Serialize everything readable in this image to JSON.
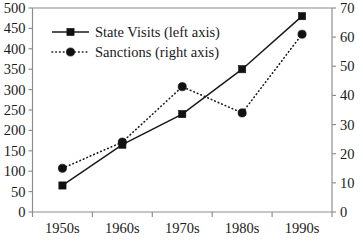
{
  "chart_data": {
    "type": "line",
    "title": "",
    "subtitle": "",
    "xlabel": "",
    "categories": [
      "1950s",
      "1960s",
      "1970s",
      "1980s",
      "1990s"
    ],
    "grid": false,
    "legend_position": "top-left",
    "series": [
      {
        "name": "State Visits (left axis)",
        "axis": "left",
        "marker": "square",
        "line_style": "solid",
        "color": "#111111",
        "values": [
          65,
          165,
          240,
          350,
          480
        ]
      },
      {
        "name": "Sanctions (right axis)",
        "axis": "right",
        "marker": "circle",
        "line_style": "dotted",
        "color": "#111111",
        "values": [
          15,
          24,
          43,
          34,
          61
        ]
      }
    ],
    "left_axis": {
      "label": "",
      "ylim": [
        0,
        500
      ],
      "tick_step": 50,
      "ticks": [
        0,
        50,
        100,
        150,
        200,
        250,
        300,
        350,
        400,
        450,
        500
      ],
      "tick_labels": [
        "0",
        "50",
        "100",
        "150",
        "200",
        "250",
        "300",
        "350",
        "400",
        "450",
        "500"
      ]
    },
    "right_axis": {
      "label": "",
      "ylim": [
        0,
        70
      ],
      "tick_step": 10,
      "ticks": [
        0,
        10,
        20,
        30,
        40,
        50,
        60,
        70
      ],
      "tick_labels": [
        "0",
        "10",
        "20",
        "30",
        "40",
        "50",
        "60",
        "70"
      ]
    },
    "colors": {
      "axis": "#8c8c8c",
      "text": "#1a1a1a",
      "series": "#111111",
      "background": "#ffffff"
    }
  }
}
